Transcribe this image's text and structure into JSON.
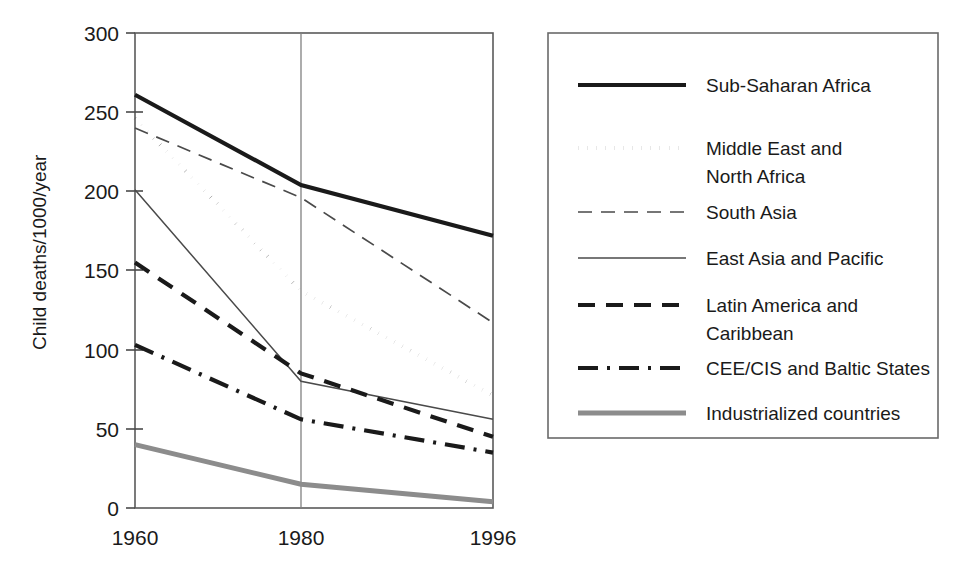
{
  "chart_data": {
    "type": "line",
    "title": "",
    "xlabel": "",
    "ylabel": "Child deaths/1000/year",
    "categories": [
      "1960",
      "1980",
      "1996"
    ],
    "x": [
      1960,
      1980,
      1996
    ],
    "xlim": [
      1960,
      1996
    ],
    "ylim": [
      0,
      300
    ],
    "yticks": [
      0,
      50,
      100,
      150,
      200,
      250,
      300
    ],
    "ytick_labels": [
      "0",
      "50",
      "100",
      "150",
      "200",
      "250",
      "300"
    ],
    "xtick_labels": [
      "1960",
      "1980",
      "1996"
    ],
    "grid": false,
    "vertical_reference_line_at": 1980,
    "legend_position": "right",
    "series": [
      {
        "name": "Sub-Saharan Africa",
        "values": [
          261,
          204,
          172
        ],
        "style": "solid-thick",
        "color": "#1a1a1a",
        "width": 4.2,
        "dash": "none"
      },
      {
        "name": "Middle East and North Africa",
        "values": [
          246,
          137,
          71
        ],
        "style": "dotted",
        "color": "#1a1a1a",
        "width": 4.0,
        "dash": "0.1,9"
      },
      {
        "name": "South Asia",
        "values": [
          240,
          196,
          117
        ],
        "style": "dashed-long-thin",
        "color": "#4a4a4a",
        "width": 1.7,
        "dash": "14,9"
      },
      {
        "name": "East Asia and Pacific",
        "values": [
          201,
          80,
          56
        ],
        "style": "solid-thin",
        "color": "#4a4a4a",
        "width": 1.5,
        "dash": "none"
      },
      {
        "name": "Latin America and Caribbean",
        "values": [
          155,
          85,
          45
        ],
        "style": "dashed-thick",
        "color": "#1a1a1a",
        "width": 4.2,
        "dash": "17,11"
      },
      {
        "name": "CEE/CIS and Baltic States",
        "values": [
          103,
          56,
          35
        ],
        "style": "dash-dot",
        "color": "#1a1a1a",
        "width": 4.2,
        "dash": "20,9,3,9"
      },
      {
        "name": "Industrialized countries",
        "values": [
          40,
          15,
          4
        ],
        "style": "solid-gray-thick",
        "color": "#8c8c8c",
        "width": 5.0,
        "dash": "none"
      }
    ]
  },
  "legend": {
    "entries": [
      {
        "label": "Sub-Saharan Africa",
        "label_line2": ""
      },
      {
        "label": "Middle East and",
        "label_line2": "North Africa"
      },
      {
        "label": "South Asia",
        "label_line2": ""
      },
      {
        "label": "East Asia and Pacific",
        "label_line2": ""
      },
      {
        "label": "Latin America and",
        "label_line2": "Caribbean"
      },
      {
        "label": "CEE/CIS and Baltic States",
        "label_line2": ""
      },
      {
        "label": "Industrialized countries",
        "label_line2": ""
      }
    ]
  },
  "colors": {
    "background": "#ffffff",
    "frame": "#5a5a5a",
    "text": "#1a1a1a",
    "gray_series": "#8c8c8c",
    "reference_line": "#808080"
  }
}
